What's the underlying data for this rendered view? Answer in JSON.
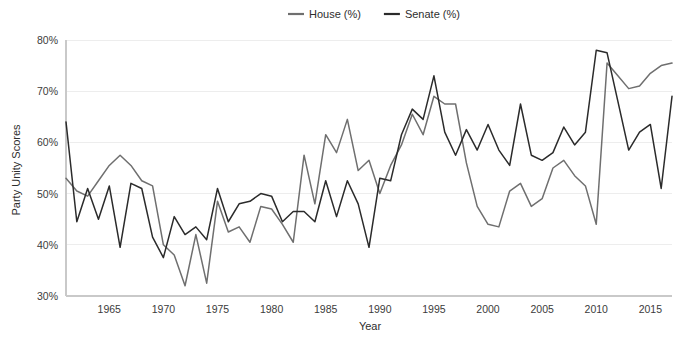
{
  "chart_data": {
    "type": "line",
    "title": "",
    "xlabel": "Year",
    "ylabel": "Party Unity Scores",
    "xlim": [
      1961,
      2017
    ],
    "ylim": [
      30,
      80
    ],
    "grid": true,
    "legend_position": "top-center",
    "x_ticks": [
      1965,
      1970,
      1975,
      1980,
      1985,
      1990,
      1995,
      2000,
      2005,
      2010,
      2015
    ],
    "x_tick_labels": [
      "1965",
      "1970",
      "1975",
      "1980",
      "1985",
      "1990",
      "1995",
      "2000",
      "2005",
      "2010",
      "2015"
    ],
    "y_ticks": [
      30,
      40,
      50,
      60,
      70,
      80
    ],
    "y_tick_labels": [
      "30%",
      "40%",
      "50%",
      "60%",
      "70%",
      "80%"
    ],
    "x": [
      1961,
      1962,
      1963,
      1964,
      1965,
      1966,
      1967,
      1968,
      1969,
      1970,
      1971,
      1972,
      1973,
      1974,
      1975,
      1976,
      1977,
      1978,
      1979,
      1980,
      1981,
      1982,
      1983,
      1984,
      1985,
      1986,
      1987,
      1988,
      1989,
      1990,
      1991,
      1992,
      1993,
      1994,
      1995,
      1996,
      1997,
      1998,
      1999,
      2000,
      2001,
      2002,
      2003,
      2004,
      2005,
      2006,
      2007,
      2008,
      2009,
      2010,
      2011,
      2012,
      2013,
      2014,
      2015,
      2016,
      2017
    ],
    "series": [
      {
        "name": "House (%)",
        "color": "#6f6f6f",
        "values": [
          53.0,
          50.5,
          49.5,
          52.5,
          55.5,
          57.5,
          55.5,
          52.5,
          51.5,
          40.0,
          38.0,
          32.0,
          42.0,
          32.5,
          48.5,
          42.5,
          43.5,
          40.5,
          47.5,
          47.0,
          44.0,
          40.5,
          57.5,
          48.0,
          61.5,
          58.0,
          64.5,
          54.5,
          56.5,
          50.0,
          55.5,
          59.5,
          65.5,
          61.5,
          69.0,
          67.5,
          67.5,
          56.0,
          47.5,
          44.0,
          43.5,
          50.5,
          52.0,
          47.5,
          49.0,
          55.0,
          56.5,
          53.5,
          51.5,
          44.0,
          75.5,
          73.0,
          70.5,
          71.0,
          73.5,
          75.0,
          75.5
        ]
      },
      {
        "name": "Senate (%)",
        "color": "#2b2b2b",
        "values": [
          64.0,
          44.5,
          51.0,
          45.0,
          51.5,
          39.5,
          52.0,
          51.0,
          41.5,
          37.5,
          45.5,
          42.0,
          43.5,
          41.0,
          51.0,
          44.5,
          48.0,
          48.5,
          50.0,
          49.5,
          44.5,
          46.5,
          46.5,
          44.5,
          52.5,
          45.5,
          52.5,
          48.0,
          39.5,
          53.0,
          52.5,
          61.5,
          66.5,
          64.5,
          73.0,
          62.0,
          57.5,
          62.5,
          58.5,
          63.5,
          58.5,
          55.5,
          67.5,
          57.5,
          56.5,
          58.0,
          63.0,
          59.5,
          62.0,
          78.0,
          77.5,
          68.0,
          58.5,
          62.0,
          63.5,
          51.0,
          69.0
        ]
      }
    ]
  },
  "legend": {
    "items": [
      {
        "label": "House (%)",
        "color": "#6f6f6f"
      },
      {
        "label": "Senate (%)",
        "color": "#2b2b2b"
      }
    ]
  },
  "axes": {
    "x_title": "Year",
    "y_title": "Party Unity Scores"
  }
}
